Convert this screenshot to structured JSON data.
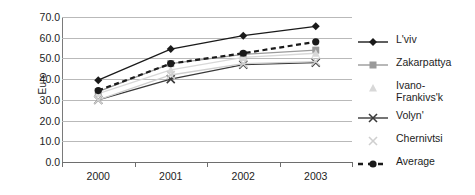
{
  "chart_data": {
    "type": "line",
    "title": "",
    "xlabel": "",
    "ylabel": "Euro",
    "categories": [
      "2000",
      "2001",
      "2002",
      "2003"
    ],
    "x": [
      2000,
      2001,
      2002,
      2003
    ],
    "ylim": [
      0.0,
      70.0
    ],
    "ytick_labels": [
      "70.0",
      "60.0",
      "50.0",
      "40.0",
      "30.0",
      "20.0",
      "10.0",
      "0.0"
    ],
    "ytick_values": [
      70.0,
      60.0,
      50.0,
      40.0,
      30.0,
      20.0,
      10.0,
      0.0
    ],
    "grid": true,
    "legend_position": "right",
    "series": [
      {
        "name": "L'viv",
        "values": [
          39.5,
          54.5,
          61.0,
          65.5
        ],
        "color": "#1a1a1a",
        "marker": "diamond",
        "dashed": false
      },
      {
        "name": "Zakarpattya",
        "values": [
          34.0,
          47.5,
          52.0,
          54.0
        ],
        "color": "#9a9a9a",
        "marker": "square",
        "dashed": false
      },
      {
        "name": "Ivano-Frankivs'k",
        "values": [
          33.0,
          44.5,
          50.5,
          52.5
        ],
        "color": "#d8d8d8",
        "marker": "triangle",
        "dashed": false
      },
      {
        "name": "Volyn'",
        "values": [
          30.0,
          40.0,
          47.0,
          48.0
        ],
        "color": "#3a3a3a",
        "marker": "cross",
        "dashed": false
      },
      {
        "name": "Chernivtsi",
        "values": [
          30.0,
          42.0,
          47.5,
          48.5
        ],
        "color": "#cfcfcf",
        "marker": "star",
        "dashed": false
      },
      {
        "name": "Average",
        "values": [
          34.5,
          47.5,
          52.5,
          58.0
        ],
        "color": "#1a1a1a",
        "marker": "circle",
        "dashed": true
      }
    ]
  },
  "legend": {
    "items": [
      {
        "label": "L'viv"
      },
      {
        "label": "Zakarpattya"
      },
      {
        "label": "Ivano-\nFrankivs'k"
      },
      {
        "label": "Volyn'"
      },
      {
        "label": "Chernivtsi"
      },
      {
        "label": "Average"
      }
    ]
  }
}
